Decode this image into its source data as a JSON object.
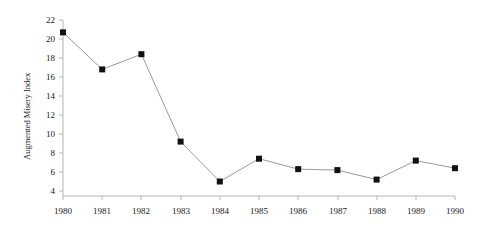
{
  "chart_data": {
    "type": "line",
    "title": "",
    "xlabel": "",
    "ylabel": "Augmented Misery Index",
    "x": [
      1980,
      1981,
      1982,
      1983,
      1984,
      1985,
      1986,
      1987,
      1988,
      1989,
      1990
    ],
    "values": [
      20.7,
      16.8,
      18.4,
      9.2,
      5.0,
      7.4,
      6.3,
      6.2,
      5.2,
      7.2,
      6.4
    ],
    "xticklabels": [
      "1980",
      "1981",
      "1982",
      "1983",
      "1984",
      "1985",
      "1986",
      "1987",
      "1988",
      "1989",
      "1990"
    ],
    "yticklabels": [
      "4",
      "6",
      "8",
      "10",
      "12",
      "14",
      "16",
      "18",
      "20",
      "22"
    ],
    "yticks": [
      4,
      6,
      8,
      10,
      12,
      14,
      16,
      18,
      20,
      22
    ],
    "ylim": [
      4,
      22
    ],
    "xlim": [
      1980,
      1990
    ],
    "grid": false,
    "legend": null,
    "marker": "square",
    "marker_color": "#111111",
    "line_color": "#9a9a9a",
    "axis_color": "#b5b5b5"
  }
}
